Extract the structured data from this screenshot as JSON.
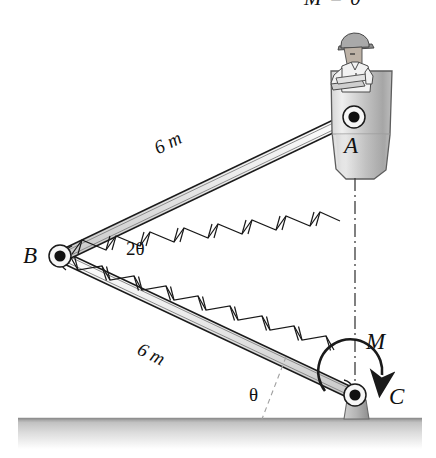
{
  "figure": {
    "title_fragment": "M = 0",
    "labels": {
      "point_a": "A",
      "point_b": "B",
      "point_c": "C",
      "moment": "M",
      "angle_b": "2θ",
      "angle_c": "θ",
      "length_upper": "6 m",
      "length_lower": "6 m"
    },
    "geometry": {
      "pin_a": {
        "x": 354,
        "y": 117
      },
      "pin_b": {
        "x": 60,
        "y": 256
      },
      "pin_c": {
        "x": 355,
        "y": 395
      },
      "ground_y": 418,
      "centerline_top": {
        "x": 355,
        "y": 178
      },
      "centerline_bottom": {
        "x": 355,
        "y": 385
      }
    },
    "colors": {
      "stroke": "#1a1a1a",
      "ground_dark": "#9a9a9a",
      "ground_light": "#fdfdfd",
      "bucket_light": "#e9e9e9",
      "bucket_mid": "#c9c9c9",
      "bucket_dark": "#a8a8a8",
      "member_fill": "#f4f4f4",
      "member_shade": "#d6d6d6",
      "skin": "#bdb2a6",
      "shirt": "#f2f2f2",
      "helmet": "#a9a9a9"
    },
    "members": [
      {
        "name": "upper-boom",
        "from": "B",
        "to": "A",
        "length": "6 m",
        "bays": 8
      },
      {
        "name": "lower-boom",
        "from": "B",
        "to": "C",
        "length": "6 m",
        "bays": 9
      }
    ]
  }
}
